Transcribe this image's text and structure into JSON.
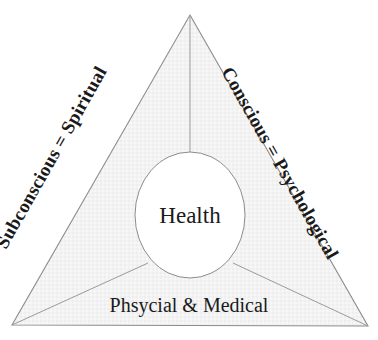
{
  "diagram": {
    "type": "triangle-venn",
    "center": {
      "label": "Health"
    },
    "segments": [
      {
        "id": "left",
        "label": "Subconscious = Spiritual",
        "position": "left-edge",
        "rotation_deg": -60.5
      },
      {
        "id": "right",
        "label": "Conscious = Psychological",
        "position": "right-edge",
        "rotation_deg": 60.5
      },
      {
        "id": "bottom",
        "label": "Phsycial & Medical",
        "position": "bottom-edge",
        "rotation_deg": 0
      }
    ],
    "colors": {
      "background": "#ffffff",
      "triangle_fill": "#f2f2f2",
      "triangle_stroke": "#8c8c8c",
      "circle_fill": "#ffffff",
      "circle_stroke": "#8c8c8c",
      "divider_stroke": "#9a9a9a",
      "text": "#1a1a1a"
    },
    "geometry": {
      "apex": "190,15",
      "bottom_left": "12,325",
      "bottom_right": "368,326",
      "circle_center": "190,215",
      "circle_rx": 55,
      "circle_ry": 63
    }
  }
}
